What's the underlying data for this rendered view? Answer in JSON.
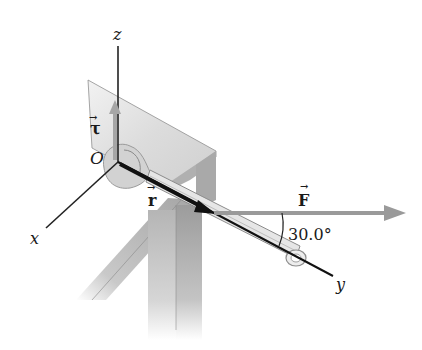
{
  "diagram": {
    "type": "physics-torque-wrench",
    "axes": {
      "z_label": "z",
      "x_label": "x",
      "y_label": "y",
      "origin_label": "O"
    },
    "vectors": {
      "torque": {
        "label": "τ",
        "arrow_glyph": "→",
        "direction": "+z",
        "color": "#a6a6a6"
      },
      "position": {
        "label": "r",
        "arrow_glyph": "→",
        "direction": "along +y (wrench)",
        "color": "#111111"
      },
      "force": {
        "label": "F",
        "arrow_glyph": "→",
        "direction": "horizontal right",
        "color": "#9a9a9a"
      }
    },
    "angle": {
      "value": "30.0°",
      "between": [
        "F",
        "y-axis"
      ]
    },
    "objects": {
      "table": {
        "color_top": "#d6d6d6",
        "color_side": "#a8a8a8"
      },
      "wrench": {
        "color": "#e2e2e2",
        "outline": "#8a8a8a"
      }
    }
  }
}
